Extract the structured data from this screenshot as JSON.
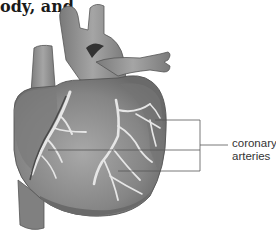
{
  "caption": "ody, and",
  "figure": {
    "labels": [
      {
        "line1": "coronary",
        "line2": "arteries"
      }
    ]
  },
  "colors": {
    "heart_dark": "#6e6e6e",
    "heart_mid": "#8c8c8c",
    "heart_light": "#b5b5b5",
    "artery": "#e8e8e8",
    "leader": "#555555"
  }
}
